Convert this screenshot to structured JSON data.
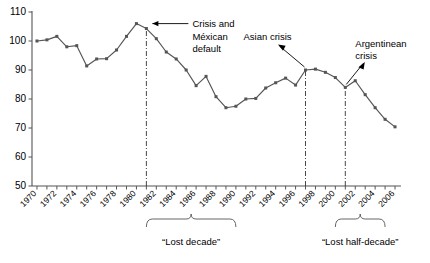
{
  "chart_data": {
    "type": "line",
    "title": "",
    "xlabel": "",
    "ylabel": "",
    "xlim": [
      1969.5,
      2006.5
    ],
    "ylim": [
      50,
      110
    ],
    "grid": false,
    "legend": "none",
    "ytick_labels": [
      "110",
      "100",
      "90",
      "80",
      "70",
      "60",
      "50"
    ],
    "ytick_values": [
      110,
      100,
      90,
      80,
      70,
      60,
      50
    ],
    "xtick_labels": [
      "1970",
      "1972",
      "1974",
      "1976",
      "1978",
      "1980",
      "1982",
      "1984",
      "1986",
      "1988",
      "1990",
      "1992",
      "1994",
      "1996",
      "1998",
      "2000",
      "2002",
      "2004",
      "2006"
    ],
    "xtick_values": [
      1970,
      1972,
      1974,
      1976,
      1978,
      1980,
      1982,
      1984,
      1986,
      1988,
      1990,
      1992,
      1994,
      1996,
      1998,
      2000,
      2002,
      2004,
      2006
    ],
    "x": [
      1970,
      1971,
      1972,
      1973,
      1974,
      1975,
      1976,
      1977,
      1978,
      1979,
      1980,
      1981,
      1982,
      1983,
      1984,
      1985,
      1986,
      1987,
      1988,
      1989,
      1990,
      1991,
      1992,
      1993,
      1994,
      1995,
      1996,
      1997,
      1998,
      1999,
      2000,
      2001,
      2002,
      2003,
      2004,
      2005,
      2006
    ],
    "series": [
      {
        "name": "GDP per capita index",
        "values": [
          100.0,
          100.4,
          101.6,
          98.0,
          98.4,
          91.4,
          93.8,
          93.9,
          96.9,
          101.6,
          106.0,
          104.3,
          100.8,
          96.2,
          93.8,
          90.0,
          84.6,
          87.8,
          80.8,
          77.0,
          77.5,
          80.0,
          80.2,
          83.8,
          85.6,
          87.2,
          84.8,
          90.0,
          90.3,
          89.2,
          87.4,
          84.0,
          86.3,
          81.5,
          77.0,
          73.0,
          70.4
        ]
      }
    ],
    "event_lines": [
      {
        "name": "mexican-default-line",
        "x": 1981
      },
      {
        "name": "asian-crisis-line",
        "x": 1997
      },
      {
        "name": "argentinean-crisis-line",
        "x": 2001
      }
    ],
    "annotations": [
      {
        "name": "crisis-mexican-default",
        "lines": [
          "Crisis and",
          "Méxican",
          "default"
        ],
        "target_x": 1981,
        "target_y": 106.0
      },
      {
        "name": "asian-crisis",
        "lines": [
          "Asian crisis"
        ],
        "target_x": 1997,
        "target_y": 90.0
      },
      {
        "name": "argentinean-crisis",
        "lines": [
          "Argentinean",
          "crisis"
        ],
        "target_x": 2001,
        "target_y": 84.0
      }
    ],
    "brackets": [
      {
        "name": "lost-decade",
        "label": "“Lost decade”",
        "from_x": 1981,
        "to_x": 1990
      },
      {
        "name": "lost-half-decade",
        "label": "“Lost half-decade”",
        "from_x": 2000,
        "to_x": 2005
      }
    ],
    "colors": {
      "line": "#555555",
      "marker": "#555555",
      "axis": "#555555",
      "text": "#000000",
      "background": "#ffffff"
    }
  }
}
